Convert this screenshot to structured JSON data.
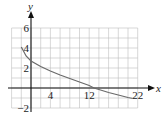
{
  "chart_data": {
    "type": "line",
    "title": "",
    "xlabel": "x",
    "ylabel": "y",
    "xlim": [
      -4,
      22
    ],
    "ylim": [
      -2,
      6
    ],
    "grid": true,
    "x_ticks": [
      4,
      12,
      22
    ],
    "y_ticks": [
      6,
      4,
      2,
      -2
    ],
    "x_tick_labels": [
      "4",
      "12",
      "22"
    ],
    "y_tick_labels": [
      "6",
      "4",
      "2",
      "−2"
    ],
    "series": [
      {
        "name": "curve",
        "x": [
          -2,
          -1,
          0,
          2,
          4,
          6,
          8,
          10,
          12,
          13,
          14,
          16,
          18,
          20,
          21
        ],
        "y": [
          4.1,
          3.2,
          2.7,
          2.15,
          1.7,
          1.3,
          0.95,
          0.6,
          0.25,
          0.0,
          -0.15,
          -0.45,
          -0.7,
          -0.95,
          -1.05
        ],
        "color": "#6a6a6a"
      }
    ]
  }
}
